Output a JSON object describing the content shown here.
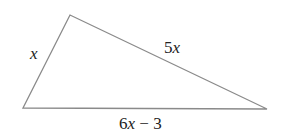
{
  "diagram": {
    "type": "triangle",
    "vertices": {
      "left": [
        23,
        108
      ],
      "top": [
        70,
        15
      ],
      "right": [
        267,
        109
      ]
    },
    "stroke_color": "#8a8a8a",
    "sides": {
      "left_side": {
        "label_var": "x",
        "label_rest": ""
      },
      "top_side": {
        "label_coef": "5",
        "label_var": "x"
      },
      "bottom_side": {
        "label_coef": "6",
        "label_var": "x",
        "label_rest": " − 3"
      }
    }
  }
}
